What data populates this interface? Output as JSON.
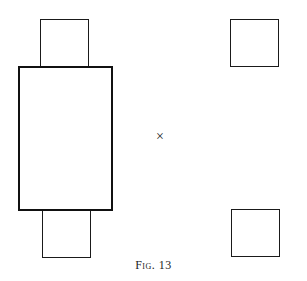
{
  "figure": {
    "caption": "Fig. 13",
    "center_mark": "×",
    "shapes": {
      "large_rect": {
        "x": 18,
        "y": 66,
        "w": 95,
        "h": 145
      },
      "small_top_left": {
        "x": 40,
        "y": 19,
        "w": 49,
        "h": 49
      },
      "small_bottom_left": {
        "x": 42,
        "y": 209,
        "w": 49,
        "h": 49
      },
      "small_top_right": {
        "x": 230,
        "y": 19,
        "w": 49,
        "h": 48
      },
      "small_bottom_right": {
        "x": 231,
        "y": 209,
        "w": 49,
        "h": 48
      }
    }
  }
}
